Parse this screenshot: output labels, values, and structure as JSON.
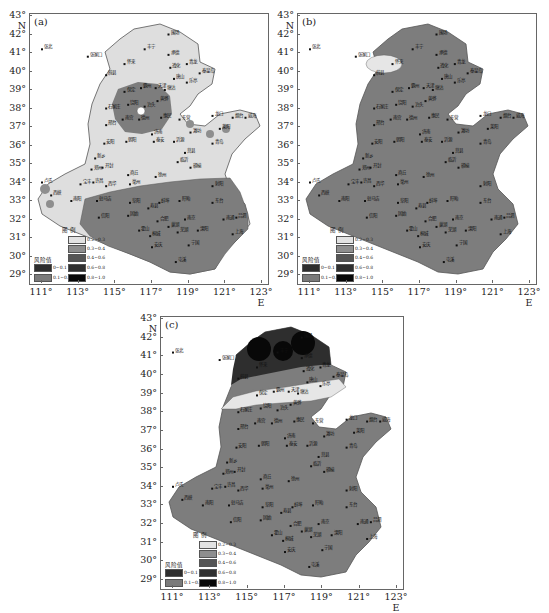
{
  "figure": {
    "panels": [
      {
        "id": "a",
        "label": "(a)"
      },
      {
        "id": "b",
        "label": "(b)"
      },
      {
        "id": "c",
        "label": "(c)"
      }
    ],
    "axes": {
      "y_ticks": [
        "43° N",
        "42°",
        "41°",
        "40°",
        "39°",
        "38°",
        "37°",
        "36°",
        "35°",
        "34°",
        "33°",
        "32°",
        "31°",
        "30°",
        "29°"
      ],
      "x_ticks": [
        "111°",
        "113°",
        "115°",
        "117°",
        "119°",
        "121°",
        "123° E"
      ]
    },
    "legend": {
      "title": "图 例",
      "risk_label": "风险值",
      "classes": [
        {
          "range": "0~0.1",
          "color": "#2e2e2e"
        },
        {
          "range": "0.1~0.2",
          "color": "#7a7a7a"
        },
        {
          "range": "0.2~0.3",
          "color": "#e2e2e2"
        },
        {
          "range": "0.3~0.4",
          "color": "#8e8e8e"
        },
        {
          "range": "0.4~0.6",
          "color": "#555555"
        },
        {
          "range": "0.6~0.8",
          "color": "#303030"
        },
        {
          "range": "0.8~1.0",
          "color": "#080808"
        }
      ]
    },
    "colors": {
      "light": "#dedede",
      "medium": "#7d7d7d",
      "darkmed": "#5c5c5c",
      "dark": "#2b2b2b",
      "border": "#555555"
    },
    "cities": [
      {
        "name": "张北",
        "x": 111,
        "y": 41.2
      },
      {
        "name": "张家口",
        "x": 113.5,
        "y": 40.8
      },
      {
        "name": "丰宁",
        "x": 116.6,
        "y": 41.2
      },
      {
        "name": "围场",
        "x": 117.9,
        "y": 42.0
      },
      {
        "name": "承德",
        "x": 117.9,
        "y": 40.9
      },
      {
        "name": "怀来",
        "x": 115.5,
        "y": 40.4
      },
      {
        "name": "蔚县",
        "x": 114.5,
        "y": 39.8
      },
      {
        "name": "遵化",
        "x": 118.0,
        "y": 40.2
      },
      {
        "name": "青龙",
        "x": 118.9,
        "y": 40.4
      },
      {
        "name": "秦皇岛",
        "x": 119.6,
        "y": 39.9
      },
      {
        "name": "唐山",
        "x": 118.2,
        "y": 39.6
      },
      {
        "name": "乐亭",
        "x": 118.9,
        "y": 39.4
      },
      {
        "name": "保定",
        "x": 115.5,
        "y": 38.9
      },
      {
        "name": "霸州",
        "x": 116.4,
        "y": 39.1
      },
      {
        "name": "天津",
        "x": 117.2,
        "y": 39.1
      },
      {
        "name": "塘沽",
        "x": 117.7,
        "y": 39.0
      },
      {
        "name": "黄骅",
        "x": 117.3,
        "y": 38.4
      },
      {
        "name": "石家庄",
        "x": 114.5,
        "y": 38.0
      },
      {
        "name": "饶阳",
        "x": 115.7,
        "y": 38.2
      },
      {
        "name": "泊头",
        "x": 116.6,
        "y": 38.1
      },
      {
        "name": "邢台",
        "x": 114.5,
        "y": 37.1
      },
      {
        "name": "南宫",
        "x": 115.4,
        "y": 37.4
      },
      {
        "name": "德州",
        "x": 116.3,
        "y": 37.4
      },
      {
        "name": "惠民",
        "x": 117.5,
        "y": 37.5
      },
      {
        "name": "东营",
        "x": 118.5,
        "y": 37.4
      },
      {
        "name": "龙口",
        "x": 120.3,
        "y": 37.6
      },
      {
        "name": "烟台",
        "x": 121.4,
        "y": 37.5
      },
      {
        "name": "威海",
        "x": 122.1,
        "y": 37.5
      },
      {
        "name": "莱阳",
        "x": 120.7,
        "y": 36.9
      },
      {
        "name": "潍坊",
        "x": 119.1,
        "y": 36.7
      },
      {
        "name": "济南",
        "x": 117.0,
        "y": 36.6
      },
      {
        "name": "泰安",
        "x": 117.1,
        "y": 36.2
      },
      {
        "name": "沂源",
        "x": 118.2,
        "y": 36.2
      },
      {
        "name": "青岛",
        "x": 120.3,
        "y": 36.1
      },
      {
        "name": "安阳",
        "x": 114.4,
        "y": 36.1
      },
      {
        "name": "朝阳",
        "x": 115.6,
        "y": 36.2
      },
      {
        "name": "新乡",
        "x": 113.9,
        "y": 35.3
      },
      {
        "name": "郑州",
        "x": 113.7,
        "y": 34.7
      },
      {
        "name": "开封",
        "x": 114.3,
        "y": 34.8
      },
      {
        "name": "商丘",
        "x": 115.7,
        "y": 34.4
      },
      {
        "name": "徐州",
        "x": 117.2,
        "y": 34.3
      },
      {
        "name": "赣榆",
        "x": 119.1,
        "y": 34.8
      },
      {
        "name": "临沂",
        "x": 118.4,
        "y": 35.1
      },
      {
        "name": "莒县",
        "x": 118.8,
        "y": 35.6
      },
      {
        "name": "射阳",
        "x": 120.3,
        "y": 33.8
      },
      {
        "name": "卢氏",
        "x": 111.0,
        "y": 34.0
      },
      {
        "name": "宝丰",
        "x": 113.1,
        "y": 33.9
      },
      {
        "name": "许昌",
        "x": 113.8,
        "y": 34.0
      },
      {
        "name": "西华",
        "x": 114.5,
        "y": 33.8
      },
      {
        "name": "亳州",
        "x": 115.8,
        "y": 33.9
      },
      {
        "name": "西峡",
        "x": 111.5,
        "y": 33.3
      },
      {
        "name": "南阳",
        "x": 112.6,
        "y": 33.0
      },
      {
        "name": "驻马店",
        "x": 114.0,
        "y": 33.0
      },
      {
        "name": "阜阳",
        "x": 115.8,
        "y": 32.9
      },
      {
        "name": "蚌埠",
        "x": 117.4,
        "y": 32.9
      },
      {
        "name": "盱眙",
        "x": 118.5,
        "y": 33.0
      },
      {
        "name": "东台",
        "x": 120.3,
        "y": 32.9
      },
      {
        "name": "信阳",
        "x": 114.1,
        "y": 32.1
      },
      {
        "name": "固始",
        "x": 115.7,
        "y": 32.2
      },
      {
        "name": "寿县",
        "x": 116.8,
        "y": 32.6
      },
      {
        "name": "南京",
        "x": 118.8,
        "y": 32.0
      },
      {
        "name": "南通",
        "x": 120.9,
        "y": 32.0
      },
      {
        "name": "吕泗",
        "x": 121.6,
        "y": 32.1
      },
      {
        "name": "合肥",
        "x": 117.3,
        "y": 31.9
      },
      {
        "name": "霍山",
        "x": 116.3,
        "y": 31.4
      },
      {
        "name": "巢湖",
        "x": 117.9,
        "y": 31.6
      },
      {
        "name": "溧阳",
        "x": 119.5,
        "y": 31.4
      },
      {
        "name": "上海",
        "x": 121.4,
        "y": 31.2
      },
      {
        "name": "桐城",
        "x": 116.9,
        "y": 31.1
      },
      {
        "name": "芜湖",
        "x": 118.4,
        "y": 31.3
      },
      {
        "name": "安庆",
        "x": 117.0,
        "y": 30.5
      },
      {
        "name": "宁国",
        "x": 119.0,
        "y": 30.6
      },
      {
        "name": "屯溪",
        "x": 118.3,
        "y": 29.7
      }
    ]
  }
}
